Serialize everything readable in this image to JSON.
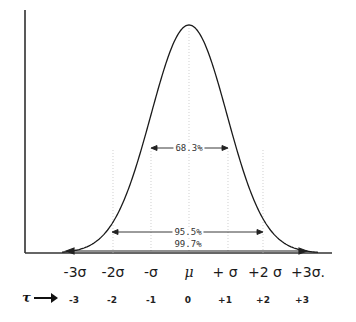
{
  "chart_data": {
    "type": "line",
    "curve": "normal bell curve centered at mu",
    "x_ticks": [
      "-3σ",
      "-2σ",
      "-σ",
      "μ",
      "+σ",
      "+2σ",
      "+3σ."
    ],
    "t_label": "τ",
    "t_values": [
      "-3",
      "-2",
      "-1",
      "0",
      "+1",
      "+2",
      "+3"
    ],
    "intervals": [
      {
        "label": "68.3%",
        "from": -1,
        "to": 1
      },
      {
        "label": "95.5%",
        "from": -2,
        "to": 2
      },
      {
        "label": "99.7%",
        "from": -3,
        "to": 3
      }
    ],
    "grid": "dotted vertical lines at each sigma",
    "xlabel": "",
    "ylabel": ""
  },
  "labels": {
    "sigma": [
      "-3σ",
      "-2σ",
      "-σ",
      "μ",
      "+ σ",
      "+2 σ",
      "+3σ."
    ],
    "t": [
      "-3",
      "-2",
      "-1",
      "0",
      "+1",
      "+2",
      "+3"
    ],
    "tau": "τ",
    "pct68": "68.3%",
    "pct95": "95.5%",
    "pct99": "99.7%"
  }
}
